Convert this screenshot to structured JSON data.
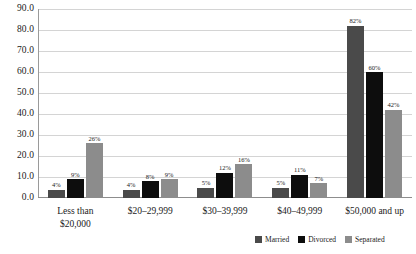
{
  "chart_data": {
    "type": "bar",
    "title": "",
    "subtitle": "",
    "xlabel": "",
    "ylabel": "",
    "ylim": [
      0,
      90
    ],
    "ytick_step": 10,
    "grid": true,
    "legend_position": "bottom-right",
    "value_label_suffix": "%",
    "categories": [
      "Less than\n$20,000",
      "$20–29,999",
      "$30–39,999",
      "$40–49,999",
      "$50,000 and up"
    ],
    "ytick_labels": [
      "90.0",
      "80.0",
      "70.0",
      "60.0",
      "50.0",
      "40.0",
      "30.0",
      "20.0",
      "10.0",
      "0.0"
    ],
    "ytick_values": [
      90,
      80,
      70,
      60,
      50,
      40,
      30,
      20,
      10,
      0
    ],
    "series": [
      {
        "name": "Married",
        "color": "#4a4a4a",
        "values": [
          4,
          4,
          5,
          5,
          82
        ],
        "labels": [
          "4%",
          "4%",
          "5%",
          "5%",
          "82%"
        ]
      },
      {
        "name": "Divorced",
        "color": "#0d0d0d",
        "values": [
          9,
          8,
          12,
          11,
          60
        ],
        "labels": [
          "9%",
          "8%",
          "12%",
          "11%",
          "60%"
        ]
      },
      {
        "name": "Separated",
        "color": "#8c8c8c",
        "values": [
          26,
          9,
          16,
          7,
          42
        ],
        "labels": [
          "26%",
          "9%",
          "16%",
          "7%",
          "42%"
        ]
      }
    ]
  },
  "colors": {
    "gridline": "#d4d4d4",
    "axis": "#8d8d8d",
    "text": "#1a1a1a",
    "background": "#ffffff"
  }
}
